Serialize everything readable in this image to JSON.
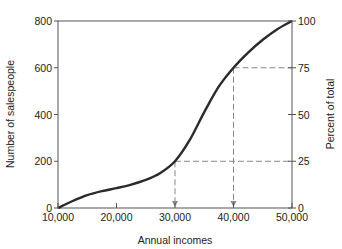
{
  "chart_data": {
    "type": "line",
    "title": "",
    "xlabel": "Annual incomes",
    "ylabel": "Number of salespeople",
    "y2label": "Percent of total",
    "xlim": [
      10000,
      50000
    ],
    "ylim": [
      0,
      800
    ],
    "y2lim": [
      0,
      100
    ],
    "x_ticks": [
      10000,
      20000,
      30000,
      40000,
      50000
    ],
    "x_tick_labels": [
      "10,000",
      "20,000",
      "30,000",
      "40,000",
      "50,000"
    ],
    "y_ticks": [
      0,
      200,
      400,
      600,
      800
    ],
    "y_tick_labels": [
      "0",
      "200",
      "400",
      "600",
      "800"
    ],
    "y2_ticks": [
      0,
      25,
      50,
      75,
      100
    ],
    "y2_tick_labels": [
      "0",
      "25",
      "50",
      "75",
      "100"
    ],
    "grid": false,
    "series": [
      {
        "name": "Cumulative salespeople (ogive)",
        "x": [
          10000,
          12500,
          15000,
          17500,
          20000,
          22500,
          25000,
          27500,
          30000,
          32500,
          35000,
          37500,
          40000,
          42500,
          45000,
          47500,
          50000
        ],
        "values": [
          0,
          30,
          55,
          72,
          85,
          100,
          120,
          150,
          200,
          290,
          410,
          520,
          600,
          665,
          720,
          765,
          800
        ]
      }
    ],
    "annotations": [
      {
        "type": "dashed-reference",
        "y_percent": 25,
        "x": 30000,
        "label": "25th percentile at 30,000"
      },
      {
        "type": "dashed-reference",
        "y_percent": 75,
        "x": 40000,
        "label": "75th percentile at 40,000"
      }
    ]
  },
  "colors": {
    "curve": "#2a2a2a",
    "axis": "#555555",
    "dashed": "#888888"
  }
}
